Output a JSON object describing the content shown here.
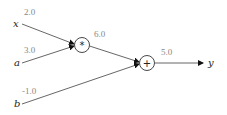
{
  "diagram": {
    "type": "computational-graph",
    "inputs": [
      {
        "name": "x",
        "value": "2.0"
      },
      {
        "name": "a",
        "value": "3.0"
      },
      {
        "name": "b",
        "value": "-1.0"
      }
    ],
    "nodes": [
      {
        "id": "mul",
        "op": "*",
        "output_value": "6.0"
      },
      {
        "id": "add",
        "op": "+",
        "output_value": "5.0"
      }
    ],
    "output": {
      "name": "y"
    },
    "edges": [
      {
        "from": "x",
        "to": "mul"
      },
      {
        "from": "a",
        "to": "mul"
      },
      {
        "from": "mul",
        "to": "add"
      },
      {
        "from": "b",
        "to": "add"
      },
      {
        "from": "add",
        "to": "y"
      }
    ],
    "colors": {
      "edge": "#555555",
      "value_text": "#888888",
      "label_text": "#222222"
    }
  }
}
